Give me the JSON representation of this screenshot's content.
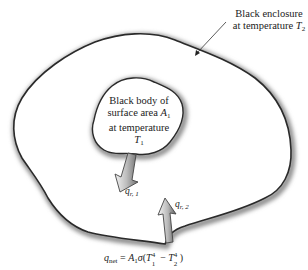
{
  "diagram": {
    "enclosure_label": {
      "line1": "Black enclosure",
      "line2_prefix": "at temperature ",
      "line2_var": "T",
      "line2_sub": "2"
    },
    "body_label": {
      "line1": "Black body of",
      "line2_prefix": "surface area ",
      "line2_var": "A",
      "line2_sub": "1",
      "line3": "at temperature",
      "line4_var": "T",
      "line4_sub": "1"
    },
    "arrow_1": {
      "var": "q",
      "sub": "r, 1",
      "direction": "outward from body"
    },
    "arrow_2": {
      "var": "q",
      "sub": "r, 2",
      "direction": "inward from enclosure"
    },
    "equation": {
      "lhs_var": "q",
      "lhs_sub": "net",
      "equals": " = ",
      "a": "A",
      "a_sub": "1",
      "sigma": "σ",
      "open": "(",
      "t1": "T",
      "t1_sub": "1",
      "t1_sup": "4",
      "minus": " − ",
      "t2": "T",
      "t2_sub": "2",
      "t2_sup": "4",
      "close": ")"
    },
    "colors": {
      "outline": "#2a2a2a",
      "shadow": "#9a9a9a",
      "arrow_fill_light": "#e8e8e8",
      "arrow_fill_dark": "#7a7a7a",
      "text": "#222222"
    }
  }
}
